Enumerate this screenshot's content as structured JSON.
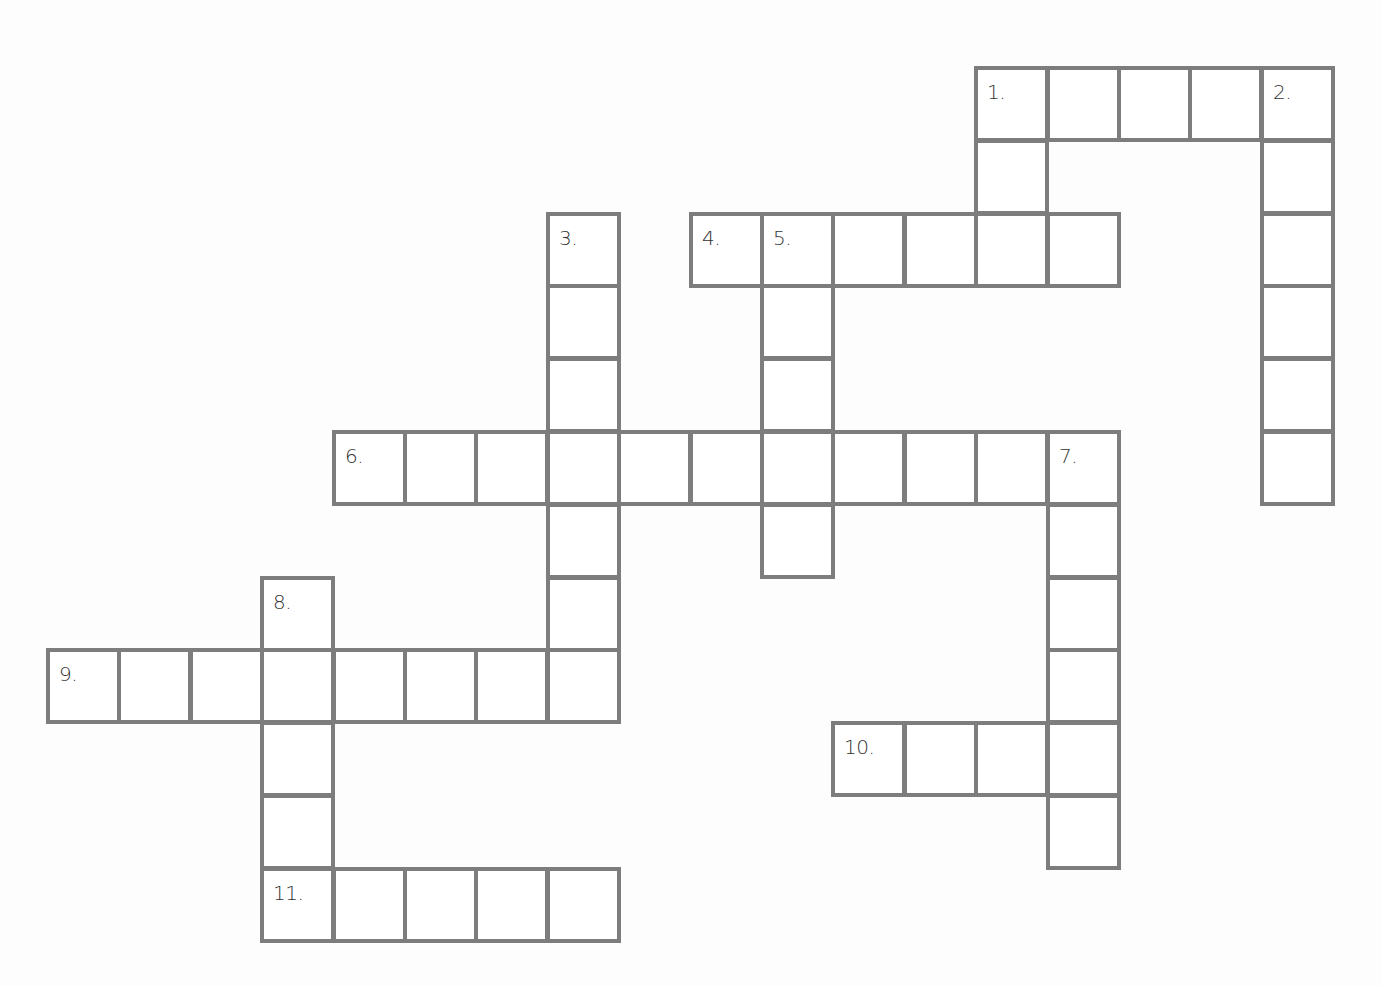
{
  "puzzle": {
    "type": "crossword",
    "grid_origin": {
      "x": 46,
      "y": 66
    },
    "cell_pitch": {
      "x": 71.4,
      "y": 72.8
    },
    "border_color": "#7d7d7d",
    "clue_numbers": [
      "1.",
      "2.",
      "3.",
      "4.",
      "5.",
      "6.",
      "7.",
      "8.",
      "9.",
      "10.",
      "11."
    ],
    "words": [
      {
        "id": "1-across",
        "number": "1.",
        "direction": "across",
        "row": 0,
        "col": 13,
        "length": 5
      },
      {
        "id": "1-down",
        "number": "1.",
        "direction": "down",
        "row": 0,
        "col": 13,
        "length": 3
      },
      {
        "id": "2-down",
        "number": "2.",
        "direction": "down",
        "row": 0,
        "col": 17,
        "length": 6
      },
      {
        "id": "3-down",
        "number": "3.",
        "direction": "down",
        "row": 2,
        "col": 7,
        "length": 7
      },
      {
        "id": "4-across",
        "number": "4.",
        "direction": "across",
        "row": 2,
        "col": 9,
        "length": 6
      },
      {
        "id": "5-down",
        "number": "5.",
        "direction": "down",
        "row": 2,
        "col": 10,
        "length": 5
      },
      {
        "id": "6-across",
        "number": "6.",
        "direction": "across",
        "row": 5,
        "col": 4,
        "length": 11
      },
      {
        "id": "7-down",
        "number": "7.",
        "direction": "down",
        "row": 5,
        "col": 14,
        "length": 6
      },
      {
        "id": "8-down",
        "number": "8.",
        "direction": "down",
        "row": 7,
        "col": 3,
        "length": 5
      },
      {
        "id": "9-across",
        "number": "9.",
        "direction": "across",
        "row": 8,
        "col": 0,
        "length": 8
      },
      {
        "id": "10-across",
        "number": "10.",
        "direction": "across",
        "row": 9,
        "col": 11,
        "length": 4
      },
      {
        "id": "11-across",
        "number": "11.",
        "direction": "across",
        "row": 11,
        "col": 3,
        "length": 5
      }
    ]
  }
}
